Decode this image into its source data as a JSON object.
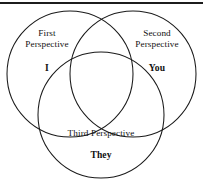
{
  "figure": {
    "background_color": "#ffffff",
    "stroke_color": "#1a1a1a",
    "rule_color": "#1c1c1c"
  },
  "sets": [
    {
      "id": "first-perspective",
      "name_line_1": "First",
      "name_line_2": "Perspective",
      "name_full": "First Perspective",
      "pronoun": "I",
      "position": "top-left",
      "center_x": 70,
      "center_y": 74,
      "radius": 63
    },
    {
      "id": "second-perspective",
      "name_line_1": "Second",
      "name_line_2": "Perspective",
      "name_full": "Second Perspective",
      "pronoun": "You",
      "position": "top-right",
      "center_x": 133,
      "center_y": 74,
      "radius": 63
    },
    {
      "id": "third-perspective",
      "name_line_1": "Third Perspective",
      "name_line_2": "",
      "name_full": "Third Perspective",
      "pronoun": "They",
      "position": "bottom-center",
      "center_x": 101,
      "center_y": 115,
      "radius": 63
    }
  ],
  "labels": {
    "first_name": "First",
    "first_name_2": "Perspective",
    "first_pronoun": "I",
    "second_name": "Second",
    "second_name_2": "Perspective",
    "second_pronoun": "You",
    "third_name": "Third Perspective",
    "third_pronoun": "They"
  }
}
